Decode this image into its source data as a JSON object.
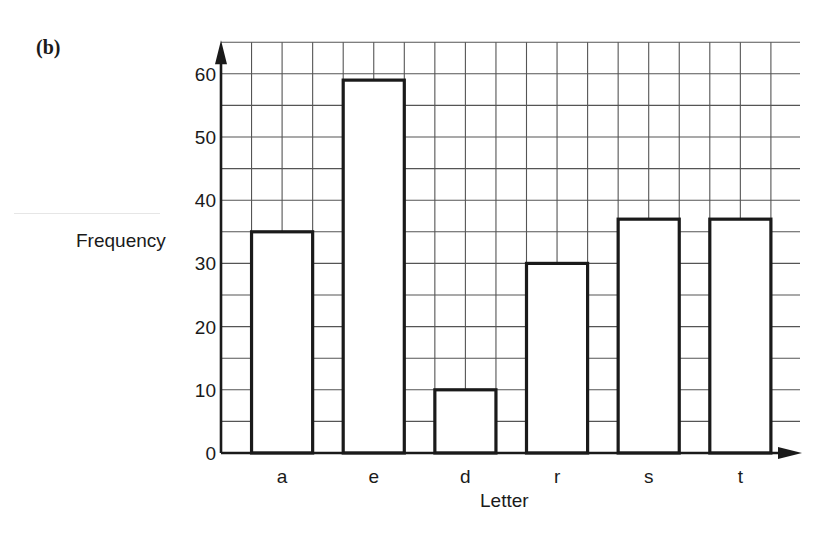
{
  "figure": {
    "part_label": "(b)"
  },
  "chart_data": {
    "type": "bar",
    "title": "",
    "xlabel": "Letter",
    "ylabel": "Frequency",
    "categories": [
      "a",
      "e",
      "d",
      "r",
      "s",
      "t"
    ],
    "values": [
      35,
      59,
      10,
      30,
      37,
      37
    ],
    "ylim": [
      0,
      65
    ],
    "yticks": [
      0,
      10,
      20,
      30,
      40,
      50,
      60
    ],
    "grid": true,
    "minor_grid_y_step": 5,
    "legend": null,
    "bar_fill": "#ffffff",
    "bar_edge": "#1a1a1a"
  }
}
